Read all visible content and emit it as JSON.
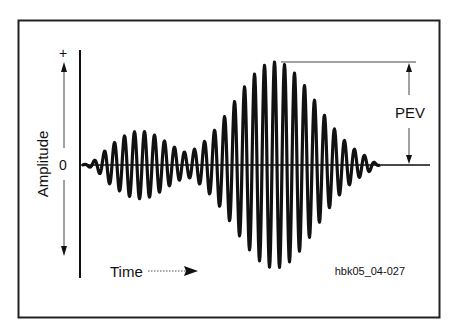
{
  "figure": {
    "y_axis_label": "Amplitude",
    "y_plus": "+",
    "y_zero": "0",
    "x_axis_label": "Time",
    "pev_label": "PEV",
    "figure_id": "hbk05_04-027"
  },
  "colors": {
    "ink": "#111111",
    "background": "#ffffff"
  }
}
